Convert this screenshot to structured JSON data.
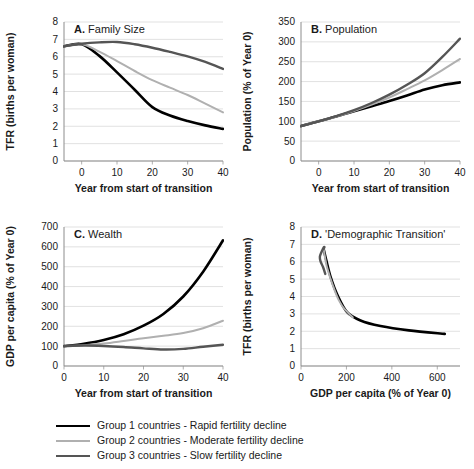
{
  "figure": {
    "panels": [
      "A",
      "B",
      "C",
      "D"
    ]
  },
  "legend": {
    "items": [
      {
        "label": "Group 1 countries - Rapid fertility decline",
        "color": "#000000",
        "width": 2.6
      },
      {
        "label": "Group 2 countries - Moderate fertility decline",
        "color": "#b0b0b0",
        "width": 2.0
      },
      {
        "label": "Group 3 countries - Slow fertility decline",
        "color": "#555555",
        "width": 2.4
      }
    ]
  },
  "chart_data": [
    {
      "id": "A",
      "type": "line",
      "title": "A. Family Size",
      "title_prefix": "A.",
      "title_text": "Family Size",
      "xlabel": "Year from start of transition",
      "ylabel": "TFR (births per woman)",
      "xlim": [
        -5,
        40
      ],
      "ylim": [
        0,
        8
      ],
      "xticks": [
        0,
        10,
        20,
        30,
        40
      ],
      "yticks": [
        0,
        1,
        2,
        3,
        4,
        5,
        6,
        7,
        8
      ],
      "grid": true,
      "x": [
        -5,
        0,
        5,
        10,
        15,
        20,
        25,
        30,
        35,
        40
      ],
      "series": [
        {
          "name": "Group 1 countries - Rapid fertility decline",
          "color": "#000000",
          "width": 2.6,
          "values": [
            6.6,
            6.72,
            6.05,
            5.1,
            4.1,
            3.1,
            2.62,
            2.3,
            2.05,
            1.85
          ]
        },
        {
          "name": "Group 2 countries - Moderate fertility decline",
          "color": "#b0b0b0",
          "width": 2.0,
          "values": [
            6.6,
            6.72,
            6.3,
            5.75,
            5.18,
            4.65,
            4.22,
            3.8,
            3.3,
            2.8
          ]
        },
        {
          "name": "Group 3 countries - Slow fertility decline",
          "color": "#555555",
          "width": 2.4,
          "values": [
            6.6,
            6.75,
            6.83,
            6.85,
            6.72,
            6.52,
            6.28,
            6.02,
            5.7,
            5.3
          ]
        }
      ]
    },
    {
      "id": "B",
      "type": "line",
      "title": "B. Population",
      "title_prefix": "B.",
      "title_text": "Population",
      "xlabel": "Year from start of transition",
      "ylabel": "Population (% of Year 0)",
      "xlim": [
        -5,
        40
      ],
      "ylim": [
        0,
        350
      ],
      "xticks": [
        0,
        10,
        20,
        30,
        40
      ],
      "yticks": [
        0,
        50,
        100,
        150,
        200,
        250,
        300,
        350
      ],
      "grid": true,
      "x": [
        -5,
        0,
        5,
        10,
        15,
        20,
        25,
        30,
        35,
        40
      ],
      "series": [
        {
          "name": "Group 1 countries - Rapid fertility decline",
          "color": "#000000",
          "width": 2.6,
          "values": [
            88,
            100,
            112,
            125,
            138,
            151,
            165,
            180,
            191,
            198
          ]
        },
        {
          "name": "Group 2 countries - Moderate fertility decline",
          "color": "#b0b0b0",
          "width": 2.0,
          "values": [
            88,
            100,
            112,
            126,
            142,
            160,
            181,
            203,
            229,
            257
          ]
        },
        {
          "name": "Group 3 countries - Slow fertility decline",
          "color": "#555555",
          "width": 2.4,
          "values": [
            88,
            100,
            113,
            128,
            146,
            167,
            192,
            221,
            262,
            308
          ]
        }
      ]
    },
    {
      "id": "C",
      "type": "line",
      "title": "C. Wealth",
      "title_prefix": "C.",
      "title_text": "Wealth",
      "xlabel": "Year from start of transition",
      "ylabel": "GDP per capita (% of Year 0)",
      "xlim": [
        0,
        40
      ],
      "ylim": [
        0,
        700
      ],
      "xticks": [
        0,
        10,
        20,
        30,
        40
      ],
      "yticks": [
        0,
        100,
        200,
        300,
        400,
        500,
        600,
        700
      ],
      "grid": true,
      "x": [
        0,
        5,
        10,
        15,
        20,
        25,
        30,
        35,
        40
      ],
      "series": [
        {
          "name": "Group 1 countries - Rapid fertility decline",
          "color": "#000000",
          "width": 2.6,
          "values": [
            100,
            112,
            131,
            160,
            203,
            262,
            350,
            475,
            633
          ]
        },
        {
          "name": "Group 2 countries - Moderate fertility decline",
          "color": "#b0b0b0",
          "width": 2.0,
          "values": [
            100,
            105,
            113,
            126,
            140,
            152,
            166,
            190,
            228
          ]
        },
        {
          "name": "Group 3 countries - Slow fertility decline",
          "color": "#555555",
          "width": 2.4,
          "values": [
            100,
            103,
            101,
            96,
            89,
            83,
            86,
            97,
            107
          ]
        }
      ]
    },
    {
      "id": "D",
      "type": "line",
      "title": "D. 'Demographic Transition'",
      "title_prefix": "D.",
      "title_text": "'Demographic Transition'",
      "xlabel": "GDP per capita (% of Year 0)",
      "ylabel": "TFR (births per woman)",
      "xlim": [
        0,
        700
      ],
      "ylim": [
        0,
        8
      ],
      "xticks": [
        0,
        200,
        400,
        600
      ],
      "yticks": [
        0,
        1,
        2,
        3,
        4,
        5,
        6,
        7,
        8
      ],
      "grid": true,
      "series": [
        {
          "name": "Group 1 countries - Rapid fertility decline",
          "color": "#000000",
          "width": 2.6,
          "points": [
            [
              100,
              6.72
            ],
            [
              112,
              6.05
            ],
            [
              131,
              5.1
            ],
            [
              160,
              4.1
            ],
            [
              203,
              3.1
            ],
            [
              262,
              2.62
            ],
            [
              350,
              2.3
            ],
            [
              475,
              2.05
            ],
            [
              633,
              1.85
            ]
          ]
        },
        {
          "name": "Group 2 countries - Moderate fertility decline",
          "color": "#b0b0b0",
          "width": 2.0,
          "points": [
            [
              100,
              6.72
            ],
            [
              105,
              6.3
            ],
            [
              113,
              5.75
            ],
            [
              126,
              5.18
            ],
            [
              140,
              4.65
            ],
            [
              152,
              4.22
            ],
            [
              166,
              3.8
            ],
            [
              190,
              3.3
            ],
            [
              228,
              2.8
            ]
          ]
        },
        {
          "name": "Group 3 countries - Slow fertility decline",
          "color": "#555555",
          "width": 2.4,
          "points": [
            [
              100,
              6.75
            ],
            [
              103,
              6.83
            ],
            [
              101,
              6.85
            ],
            [
              96,
              6.72
            ],
            [
              89,
              6.52
            ],
            [
              83,
              6.28
            ],
            [
              86,
              6.02
            ],
            [
              97,
              5.7
            ],
            [
              107,
              5.3
            ]
          ]
        }
      ]
    }
  ]
}
